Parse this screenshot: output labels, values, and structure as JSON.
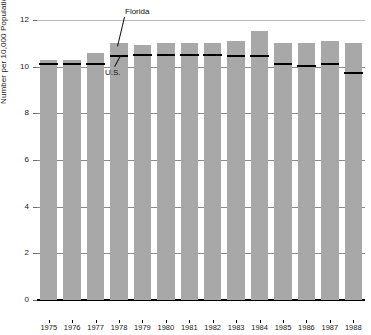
{
  "chart_data": {
    "type": "bar",
    "title": "",
    "xlabel": "",
    "ylabel": "Number per 10,000 Population",
    "ylim": [
      0,
      12
    ],
    "yticks": [
      0,
      2,
      4,
      6,
      8,
      10,
      12
    ],
    "ytick_labels": [
      "0",
      "2",
      "4",
      "6",
      "8",
      "10",
      "12"
    ],
    "grid": true,
    "legend_position": "annotated-inline",
    "categories": [
      "1975",
      "1976",
      "1977",
      "1978",
      "1979",
      "1980",
      "1981",
      "1982",
      "1983",
      "1984",
      "1985",
      "1986",
      "1987",
      "1988"
    ],
    "series": [
      {
        "name": "Florida",
        "mark": "gray-bar",
        "color": "#a8a8a8",
        "values": [
          10.3,
          10.3,
          10.6,
          11.0,
          10.95,
          11.0,
          11.0,
          11.0,
          11.1,
          11.55,
          11.0,
          11.0,
          11.1,
          11.0
        ]
      },
      {
        "name": "U.S.",
        "mark": "black-line-segment",
        "color": "#000000",
        "values": [
          10.1,
          10.1,
          10.1,
          10.45,
          10.5,
          10.5,
          10.5,
          10.5,
          10.45,
          10.45,
          10.1,
          10.05,
          10.1,
          9.75
        ]
      }
    ],
    "annotations": [
      {
        "text": "Florida",
        "target_series": "Florida",
        "target_category": "1978"
      },
      {
        "text": "U.S.",
        "target_series": "U.S.",
        "target_category": "1978"
      }
    ]
  },
  "colors": {
    "bar_fill": "#a8a8a8",
    "us_line": "#000000",
    "gridline": "#8a8a8a",
    "gridline_top": "#b9b9b9",
    "axis": "#000000",
    "background": "#ffffff",
    "text": "#1a1a1a"
  }
}
